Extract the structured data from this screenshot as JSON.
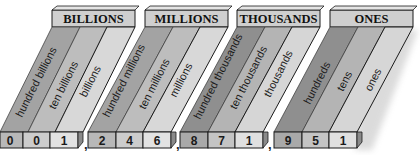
{
  "groups": [
    {
      "header": "BILLIONS",
      "places": [
        "hundred billions",
        "ten billions",
        "billions"
      ],
      "digits": [
        "0",
        "0",
        "1"
      ]
    },
    {
      "header": "MILLIONS",
      "places": [
        "hundred millions",
        "ten millions",
        "millions"
      ],
      "digits": [
        "2",
        "4",
        "6"
      ]
    },
    {
      "header": "THOUSANDS",
      "places": [
        "hundred thousands",
        "ten thousands",
        "thousands"
      ],
      "digits": [
        "8",
        "7",
        "1"
      ]
    },
    {
      "header": "ONES",
      "places": [
        "hundreds",
        "tens",
        "ones"
      ],
      "digits": [
        "9",
        "5",
        "1"
      ]
    }
  ],
  "separator": ",",
  "number": "001,246,871,951",
  "colors": {
    "header_fill": "#cfcfcf",
    "band_dark": "#8f8f8f",
    "band_mid": "#b4b4b4",
    "band_light": "#d6d6d6",
    "digit_dark": "#a9a9a9",
    "digit_mid": "#c4c4c4",
    "digit_light": "#e0e0e0",
    "outline": "#1a1a1a"
  }
}
